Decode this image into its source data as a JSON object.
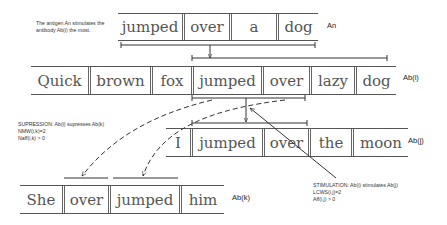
{
  "notes": {
    "antigen": [
      "The antigen An stimulates the",
      "antibody Ab(i) the most."
    ],
    "suppression": [
      "SUPRESSION: Ab(i) supresses Ab(k)",
      "NMW(i,k)=2",
      "Naff(i,k) > 0"
    ],
    "stimulation": [
      "STIMULATION: Ab(i) stimulates Ab(j)",
      "LCWS(i,j)=2",
      "Aff(i,j) > 0"
    ]
  },
  "sentences": {
    "an": {
      "label": "An",
      "words": [
        "jumped",
        "over",
        "a",
        "dog"
      ]
    },
    "abi": {
      "label": "Ab(i)",
      "words": [
        "Quick",
        "brown",
        "fox",
        "jumped",
        "over",
        "lazy",
        "dog"
      ]
    },
    "abj": {
      "label": "Ab(j)",
      "words": [
        "I",
        "jumped",
        "over",
        "the",
        "moon"
      ]
    },
    "abk": {
      "label": "Ab(k)",
      "words": [
        "She",
        "over",
        "jumped",
        "him"
      ]
    }
  }
}
